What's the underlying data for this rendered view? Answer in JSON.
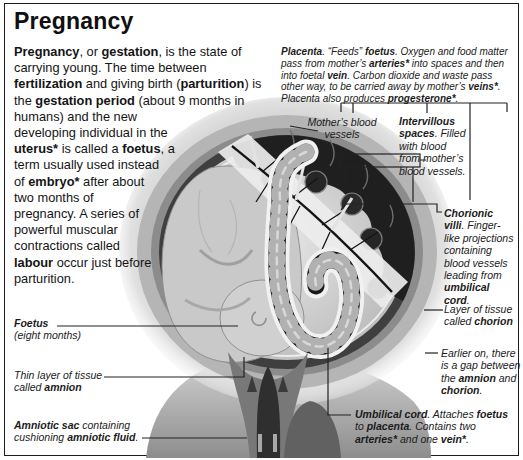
{
  "title": "Pregnancy",
  "intro_segments": [
    {
      "t": "Pregnancy",
      "b": 1
    },
    {
      "t": ", or "
    },
    {
      "t": "gestation",
      "b": 1
    },
    {
      "t": ", is the state of carrying young. The time between "
    },
    {
      "t": "fertilization",
      "b": 1
    },
    {
      "t": " and giving birth ("
    },
    {
      "t": "parturition",
      "b": 1
    },
    {
      "t": ") is the "
    },
    {
      "t": "gestation period",
      "b": 1
    },
    {
      "t": " (about 9 months in humans) and the new developing individual in the "
    },
    {
      "t": "uterus*",
      "b": 1
    },
    {
      "t": " is called a "
    },
    {
      "t": "foetus",
      "b": 1
    },
    {
      "t": ", a term usually used instead of "
    },
    {
      "t": "embryo*",
      "b": 1
    },
    {
      "t": " after about two months of pregnancy. A series of powerful muscular contractions called "
    },
    {
      "t": "labour",
      "b": 1
    },
    {
      "t": " occur just before parturition."
    }
  ],
  "annotations": {
    "placenta": [
      {
        "t": "Placenta",
        "b": 1
      },
      {
        "t": ". “Feeds” "
      },
      {
        "t": "foetus",
        "b": 1
      },
      {
        "t": ". Oxygen and food matter pass from mother’s "
      },
      {
        "t": "arteries*",
        "b": 1
      },
      {
        "t": " into spaces and then into foetal "
      },
      {
        "t": "vein",
        "b": 1
      },
      {
        "t": ". Carbon dioxide and waste pass other way, to be carried away by mother’s "
      },
      {
        "t": "veins*",
        "b": 1
      },
      {
        "t": ". Placenta also produces "
      },
      {
        "t": "progesterone*",
        "b": 1
      },
      {
        "t": "."
      }
    ],
    "mothers_blood_vessels": [
      {
        "t": "Mother’s blood\nvessels"
      }
    ],
    "intervillous_spaces": [
      {
        "t": "Intervillous spaces",
        "b": 1
      },
      {
        "t": ". Filled with blood from mother’s blood vessels."
      }
    ],
    "chorionic_villi": [
      {
        "t": "Chorionic villi",
        "b": 1
      },
      {
        "t": ". Finger-like projections containing blood vessels leading from "
      },
      {
        "t": "umbilical cord",
        "b": 1
      },
      {
        "t": "."
      }
    ],
    "chorion": [
      {
        "t": "Layer of tissue called "
      },
      {
        "t": "chorion",
        "b": 1
      }
    ],
    "amnion_chorion_gap": [
      {
        "t": "Earlier on, there is a gap between the "
      },
      {
        "t": "amnion",
        "b": 1
      },
      {
        "t": " and "
      },
      {
        "t": "chorion",
        "b": 1
      },
      {
        "t": "."
      }
    ],
    "foetus": [
      {
        "t": "Foetus",
        "b": 1
      },
      {
        "t": "\n(eight months)"
      }
    ],
    "amnion": [
      {
        "t": "Thin layer of tissue called "
      },
      {
        "t": "amnion",
        "b": 1
      }
    ],
    "amniotic_sac": [
      {
        "t": "Amniotic sac",
        "b": 1
      },
      {
        "t": " containing cushioning "
      },
      {
        "t": "amniotic fluid",
        "b": 1
      },
      {
        "t": "."
      }
    ],
    "umbilical_cord": [
      {
        "t": "Umbilical cord",
        "b": 1
      },
      {
        "t": ". Attaches "
      },
      {
        "t": "foetus",
        "b": 1
      },
      {
        "t": " to "
      },
      {
        "t": "placenta",
        "b": 1
      },
      {
        "t": ". Contains two "
      },
      {
        "t": "arteries*",
        "b": 1
      },
      {
        "t": " and one "
      },
      {
        "t": "vein*",
        "b": 1
      },
      {
        "t": "."
      }
    ]
  },
  "colors": {
    "paper": "#ffffff",
    "ink": "#161616",
    "frame": "#1c1c1c",
    "leader_line": "#222222",
    "illustration_grays": [
      "#f1f1f1",
      "#c9c9c9",
      "#8c8c8c",
      "#3f3f3f",
      "#181818"
    ]
  }
}
